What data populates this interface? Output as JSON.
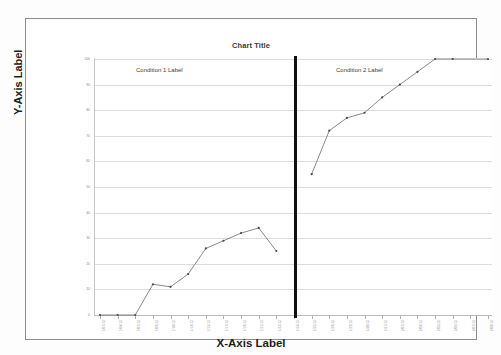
{
  "chart_data": {
    "type": "line",
    "title": "Chart Title",
    "xlabel": "X-Axis Label",
    "ylabel": "Y-Axis Label",
    "ylim": [
      0,
      100
    ],
    "ytick_step": 10,
    "yticks": [
      0,
      10,
      20,
      30,
      40,
      50,
      60,
      70,
      80,
      90,
      100
    ],
    "grid": true,
    "legend": "none",
    "annotations": [
      {
        "name": "condition-1-label",
        "text": "Condition 1 Label"
      },
      {
        "name": "condition-2-label",
        "text": "Condition 2 Label"
      },
      {
        "name": "phase-divider",
        "text": ""
      }
    ],
    "x": [
      1,
      2,
      3,
      4,
      5,
      6,
      7,
      8,
      9,
      10,
      11,
      12,
      13,
      14,
      15,
      16,
      17,
      18,
      19,
      20,
      21,
      22,
      23
    ],
    "xtick_labels": [
      "1/01/13",
      "1/04/13",
      "1/07/13",
      "1/09/13",
      "1/10/13",
      "1/14/13",
      "1/15/13",
      "1/17/13",
      "1/18/13",
      "1/21/13",
      "1/23/13",
      "1/24/13",
      "1/25/13",
      "1/28/13",
      "1/29/13",
      "1/30/13",
      "1/31/13",
      "2/01/13",
      "2/04/13",
      "2/05/13",
      "2/06/13",
      "2/07/13",
      "2/08/13"
    ],
    "series": [
      {
        "name": "Condition 1",
        "x": [
          1,
          2,
          3,
          4,
          5,
          6,
          7,
          8,
          9,
          10,
          11
        ],
        "values": [
          0,
          0,
          0,
          12,
          11,
          16,
          26,
          29,
          32,
          34,
          25
        ]
      },
      {
        "name": "Condition 2",
        "x": [
          13,
          14,
          15,
          16,
          17,
          18,
          19,
          20,
          21,
          23
        ],
        "values": [
          55,
          72,
          77,
          79,
          85,
          90,
          95,
          100,
          100,
          100
        ]
      }
    ]
  }
}
